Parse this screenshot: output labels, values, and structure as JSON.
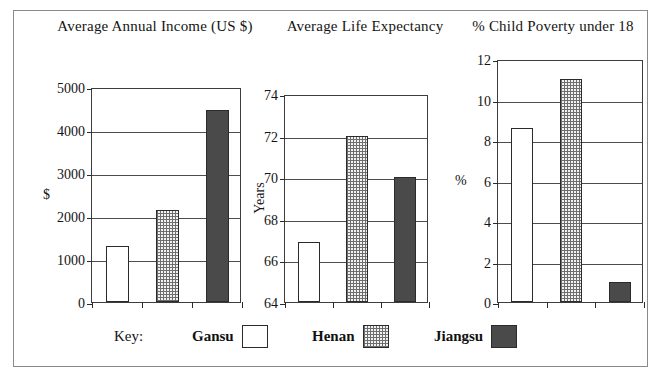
{
  "figure": {
    "border_color": "#8a8a8a",
    "background": "#ffffff"
  },
  "titles": {
    "chart1": "Average Annual Income (US $)",
    "chart2": "Average Life Expectancy",
    "chart3": "% Child Poverty under 18"
  },
  "legend": {
    "key_label": "Key:",
    "entries": [
      {
        "label": "Gansu",
        "pattern": "open",
        "color": "#ffffff"
      },
      {
        "label": "Henan",
        "pattern": "dotted",
        "color": "#cccccc"
      },
      {
        "label": "Jiangsu",
        "pattern": "solid",
        "color": "#4a4a4a"
      }
    ]
  },
  "chart_data": [
    {
      "type": "bar",
      "title": "Average Annual Income (US $)",
      "categories": [
        "Gansu",
        "Henan",
        "Jiangsu"
      ],
      "values": [
        1300,
        2150,
        4470
      ],
      "series": [
        {
          "name": "Gansu",
          "values": [
            1300
          ]
        },
        {
          "name": "Henan",
          "values": [
            2150
          ]
        },
        {
          "name": "Jiangsu",
          "values": [
            4470
          ]
        }
      ],
      "xlabel": "",
      "ylabel": "$",
      "ylim": [
        0,
        5000
      ],
      "yticks": [
        0,
        1000,
        2000,
        3000,
        4000,
        5000
      ],
      "ytick_labels": [
        "0",
        "1000",
        "2000",
        "3000",
        "4000",
        "5000"
      ],
      "grid": true,
      "legend_position": "bottom"
    },
    {
      "type": "bar",
      "title": "Average Life Expectancy",
      "categories": [
        "Gansu",
        "Henan",
        "Jiangsu"
      ],
      "values": [
        66.9,
        72.0,
        70.0
      ],
      "series": [
        {
          "name": "Gansu",
          "values": [
            66.9
          ]
        },
        {
          "name": "Henan",
          "values": [
            72.0
          ]
        },
        {
          "name": "Jiangsu",
          "values": [
            70.0
          ]
        }
      ],
      "xlabel": "",
      "ylabel": "Years",
      "ylim": [
        64,
        74
      ],
      "yticks": [
        64,
        66,
        68,
        70,
        72,
        74
      ],
      "ytick_labels": [
        "64",
        "66",
        "68",
        "70",
        "72",
        "74"
      ],
      "grid": true,
      "legend_position": "bottom"
    },
    {
      "type": "bar",
      "title": "% Child Poverty under 18",
      "categories": [
        "Gansu",
        "Henan",
        "Jiangsu"
      ],
      "values": [
        8.6,
        11.0,
        1.0
      ],
      "series": [
        {
          "name": "Gansu",
          "values": [
            8.6
          ]
        },
        {
          "name": "Henan",
          "values": [
            11.0
          ]
        },
        {
          "name": "Jiangsu",
          "values": [
            1.0
          ]
        }
      ],
      "xlabel": "",
      "ylabel": "%",
      "ylim": [
        0,
        12
      ],
      "yticks": [
        0,
        2,
        4,
        6,
        8,
        10,
        12
      ],
      "ytick_labels": [
        "0",
        "2",
        "4",
        "6",
        "8",
        "10",
        "12"
      ],
      "grid": true,
      "legend_position": "bottom"
    }
  ]
}
